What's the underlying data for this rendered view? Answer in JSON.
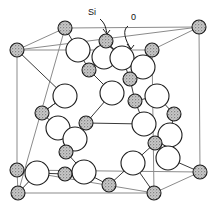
{
  "figure": {
    "type": "crystal-structure-diagram",
    "width": 221,
    "height": 213,
    "background": "#ffffff"
  },
  "labels": [
    {
      "id": "si",
      "text": "Si",
      "x": 88,
      "y": 15,
      "points_to": "si-atom-top"
    },
    {
      "id": "o",
      "text": "0",
      "x": 131,
      "y": 20,
      "points_to": "o-atom-top"
    }
  ],
  "legend_meaning": {
    "si_symbol": "small stippled grey circle",
    "o_symbol": "large open white circle"
  },
  "colors": {
    "cube_edge": "#8b8b8b",
    "bond": "#3a3a3a",
    "si_fill": "#bdbdbd",
    "o_fill": "#ffffff",
    "outline": "#1d1d1d",
    "label": "#111111"
  },
  "cube": {
    "vertices": {
      "back_top_left": [
        17,
        50
      ],
      "back_top_right": [
        199,
        27
      ],
      "front_top_left": [
        65,
        28
      ],
      "front_top_right": [
        152,
        50
      ],
      "back_bottom_left": [
        17,
        170
      ],
      "back_bottom_right": [
        200,
        172
      ],
      "front_bottom_left": [
        18,
        193
      ],
      "front_bottom_right": [
        154,
        193
      ]
    },
    "edges": [
      [
        "front_top_left",
        "back_top_right"
      ],
      [
        "front_top_left",
        "back_top_left"
      ],
      [
        "back_top_left",
        "back_top_right"
      ],
      [
        "back_top_right",
        "front_top_right"
      ],
      [
        "back_top_left",
        "front_top_right"
      ],
      [
        "front_top_left",
        "front_bottom_left"
      ],
      [
        "back_top_left",
        "back_bottom_left"
      ],
      [
        "back_top_right",
        "back_bottom_right"
      ],
      [
        "front_top_right",
        "front_bottom_right"
      ],
      [
        "front_bottom_left",
        "front_bottom_right"
      ],
      [
        "back_bottom_left",
        "back_bottom_right"
      ],
      [
        "front_bottom_left",
        "back_bottom_left"
      ],
      [
        "front_bottom_right",
        "back_bottom_right"
      ],
      [
        "back_bottom_left",
        "front_bottom_right"
      ]
    ]
  },
  "atoms": {
    "si_radius": 7,
    "o_radius": 12,
    "si": [
      {
        "id": "si-corner-bt-left",
        "x": 17,
        "y": 50
      },
      {
        "id": "si-corner-bt-right",
        "x": 199,
        "y": 27
      },
      {
        "id": "si-corner-ft-left",
        "x": 65,
        "y": 28
      },
      {
        "id": "si-corner-ft-right",
        "x": 152,
        "y": 50
      },
      {
        "id": "si-corner-bb-left",
        "x": 17,
        "y": 170
      },
      {
        "id": "si-corner-bb-right",
        "x": 200,
        "y": 172
      },
      {
        "id": "si-corner-fb-left",
        "x": 18,
        "y": 193
      },
      {
        "id": "si-corner-fb-right",
        "x": 154,
        "y": 193
      },
      {
        "id": "si-atom-top",
        "x": 106,
        "y": 41
      },
      {
        "id": "si-upper-mid",
        "x": 89,
        "y": 70
      },
      {
        "id": "si-upper-right",
        "x": 130,
        "y": 79
      },
      {
        "id": "si-mid-right",
        "x": 135,
        "y": 101
      },
      {
        "id": "si-left-mid",
        "x": 42,
        "y": 113
      },
      {
        "id": "si-right-mid",
        "x": 174,
        "y": 114
      },
      {
        "id": "si-center-left",
        "x": 86,
        "y": 123
      },
      {
        "id": "si-lower-left",
        "x": 66,
        "y": 152
      },
      {
        "id": "si-lower-right",
        "x": 155,
        "y": 143
      },
      {
        "id": "si-bottom-left",
        "x": 65,
        "y": 174
      },
      {
        "id": "si-bottom-mid",
        "x": 109,
        "y": 185
      }
    ],
    "o": [
      {
        "id": "o-top-left",
        "x": 78,
        "y": 50
      },
      {
        "id": "o-top-center",
        "x": 104,
        "y": 57
      },
      {
        "id": "o-atom-top",
        "x": 122,
        "y": 58
      },
      {
        "id": "o-top-right",
        "x": 143,
        "y": 67
      },
      {
        "id": "o-mid-left",
        "x": 65,
        "y": 96
      },
      {
        "id": "o-mid-center",
        "x": 112,
        "y": 93
      },
      {
        "id": "o-mid-right",
        "x": 157,
        "y": 96
      },
      {
        "id": "o-left-lower",
        "x": 58,
        "y": 128
      },
      {
        "id": "o-center-lower",
        "x": 75,
        "y": 139
      },
      {
        "id": "o-right-lower",
        "x": 144,
        "y": 124
      },
      {
        "id": "o-right-edge",
        "x": 170,
        "y": 135
      },
      {
        "id": "o-bottom-left",
        "x": 37,
        "y": 173
      },
      {
        "id": "o-bottom-mid",
        "x": 84,
        "y": 172
      },
      {
        "id": "o-bottom-right",
        "x": 133,
        "y": 163
      },
      {
        "id": "o-far-right",
        "x": 168,
        "y": 158
      }
    ],
    "bonds": [
      [
        "si-corner-ft-left",
        "o-top-left"
      ],
      [
        "o-top-left",
        "si-upper-mid"
      ],
      [
        "si-atom-top",
        "o-top-center"
      ],
      [
        "si-atom-top",
        "o-atom-top"
      ],
      [
        "o-atom-top",
        "si-upper-right"
      ],
      [
        "si-upper-right",
        "o-top-right"
      ],
      [
        "si-upper-mid",
        "o-mid-center"
      ],
      [
        "si-upper-mid",
        "o-top-center"
      ],
      [
        "si-upper-right",
        "si-mid-right"
      ],
      [
        "si-mid-right",
        "o-mid-right"
      ],
      [
        "si-mid-right",
        "o-right-lower"
      ],
      [
        "o-mid-left",
        "si-left-mid"
      ],
      [
        "o-mid-center",
        "si-center-left"
      ],
      [
        "si-left-mid",
        "o-left-lower"
      ],
      [
        "si-center-left",
        "o-center-lower"
      ],
      [
        "si-center-left",
        "o-right-lower"
      ],
      [
        "o-right-edge",
        "si-right-mid"
      ],
      [
        "si-right-mid",
        "o-mid-right"
      ],
      [
        "si-lower-left",
        "o-center-lower"
      ],
      [
        "si-lower-left",
        "o-bottom-mid"
      ],
      [
        "si-lower-right",
        "o-bottom-right"
      ],
      [
        "si-lower-right",
        "o-right-edge"
      ],
      [
        "si-bottom-left",
        "o-bottom-left"
      ],
      [
        "si-bottom-left",
        "o-bottom-mid"
      ],
      [
        "si-bottom-mid",
        "o-bottom-mid"
      ],
      [
        "si-bottom-mid",
        "o-bottom-right"
      ],
      [
        "si-corner-fb-left",
        "o-bottom-left"
      ],
      [
        "si-corner-bb-right",
        "o-far-right"
      ],
      [
        "o-far-right",
        "si-lower-right"
      ],
      [
        "si-corner-fb-right",
        "o-bottom-right"
      ],
      [
        "si-left-mid",
        "o-mid-left"
      ],
      [
        "si-corner-bt-left",
        "o-mid-left"
      ]
    ]
  },
  "leaders": [
    {
      "id": "si-leader",
      "path": "M 100 19 C 106 24, 106 30, 107 34"
    },
    {
      "id": "o-leader",
      "path": "M 128 26 C 122 30, 125 40, 131 49"
    }
  ]
}
